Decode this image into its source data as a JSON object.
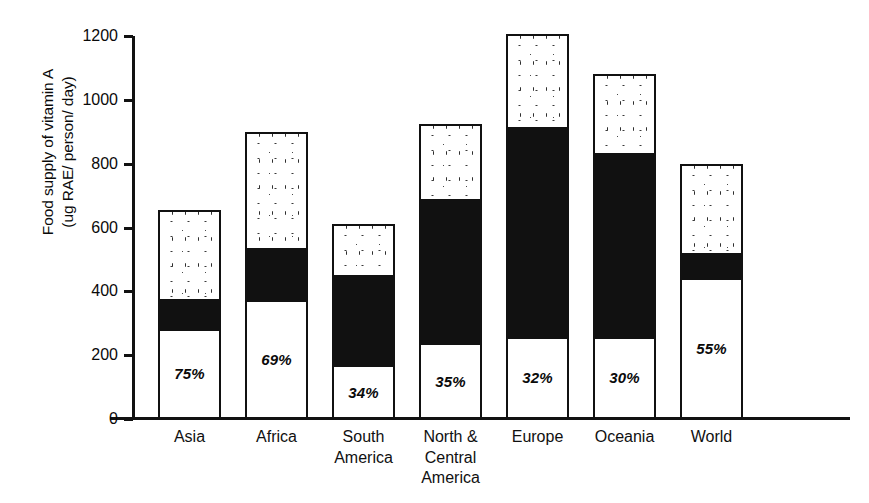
{
  "chart_data": {
    "type": "bar",
    "subtype": "stacked-bar",
    "title": "",
    "xlabel": "",
    "ylabel": "Food supply of vitamin A\n(ug RAE/ person/ day)",
    "ylabel_line1": "Food supply of vitamin A",
    "ylabel_line2": "(ug RAE/ person/ day)",
    "ylim": [
      0,
      1200
    ],
    "yticks": [
      0,
      200,
      400,
      600,
      800,
      1000,
      1200
    ],
    "ytick_labels": [
      "0",
      "200",
      "400",
      "600",
      "800",
      "1000",
      "1200"
    ],
    "grid": false,
    "legend": null,
    "categories": [
      "Asia",
      "Africa",
      "South\nAmerica",
      "North &\nCentral\nAmerica",
      "Europe",
      "Oceania",
      "World"
    ],
    "series": [
      {
        "name": "plant-source (white)",
        "style": "white-fill",
        "values": [
          280,
          370,
          165,
          235,
          255,
          255,
          440
        ]
      },
      {
        "name": "animal-source (black)",
        "style": "black-fill",
        "values": [
          95,
          165,
          285,
          455,
          660,
          580,
          80
        ]
      },
      {
        "name": "remainder (stippled)",
        "style": "stippled-fill",
        "values": [
          280,
          365,
          160,
          235,
          290,
          245,
          280
        ]
      }
    ],
    "segment_tops": {
      "white": [
        280,
        370,
        165,
        235,
        255,
        255,
        440
      ],
      "black": [
        375,
        535,
        450,
        690,
        915,
        835,
        520
      ],
      "stipple": [
        655,
        900,
        610,
        925,
        1205,
        1080,
        800
      ]
    },
    "totals": [
      655,
      900,
      610,
      925,
      1205,
      1080,
      800
    ],
    "bar_labels": [
      "75%",
      "69%",
      "34%",
      "35%",
      "32%",
      "30%",
      "55%"
    ]
  }
}
